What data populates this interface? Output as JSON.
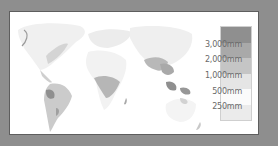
{
  "map": {
    "title": "World annual precipitation",
    "frame_color": "#8e8e8e",
    "background": "#ffffff"
  },
  "legend": {
    "swatches": [
      {
        "color": "#8f8f8f"
      },
      {
        "color": "#a9a9a9"
      },
      {
        "color": "#c5c5c5"
      },
      {
        "color": "#e5e5e5"
      },
      {
        "color": "#fbfbfb"
      },
      {
        "color": "#ebebeb"
      }
    ],
    "labels": [
      "3,000mm",
      "2,000mm",
      "1,000mm",
      "500mm",
      "250mm"
    ]
  }
}
